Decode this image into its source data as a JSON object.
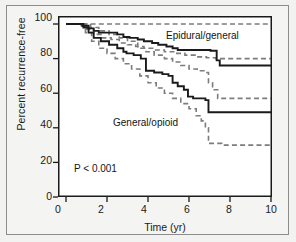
{
  "figure": {
    "background_color": "#f2f2f0",
    "plot_background": "#ffffff",
    "frame_color": "#8d8d8d"
  },
  "chart_data": {
    "type": "line",
    "subtype": "kaplan-meier-step",
    "title": "",
    "xlabel": "Time (yr)",
    "ylabel": "Percent recurrence-free",
    "xlim": [
      0,
      10
    ],
    "ylim": [
      0,
      100
    ],
    "xticks": [
      0,
      2,
      4,
      6,
      8,
      10
    ],
    "xtick_labels": [
      "0",
      "2",
      "4",
      "6",
      "8",
      "10"
    ],
    "yticks": [
      0,
      20,
      40,
      60,
      80,
      100
    ],
    "ytick_labels": [
      "0",
      "20",
      "40",
      "60",
      "80",
      "100"
    ],
    "grid": false,
    "legend_position": "inline-annotations",
    "annotations": [
      {
        "text": "Epidural/general",
        "x": 5.2,
        "y": 88
      },
      {
        "text": "General/opioid",
        "x": 2.7,
        "y": 42
      },
      {
        "text": "P < 0.001",
        "x": 0.85,
        "y": 17
      }
    ],
    "series": [
      {
        "name": "Epidural/general",
        "style": "solid",
        "color": "#1a1a1a",
        "width": 1.9,
        "points": [
          [
            0.0,
            100
          ],
          [
            0.45,
            100
          ],
          [
            0.8,
            99
          ],
          [
            1.1,
            97.5
          ],
          [
            1.35,
            96
          ],
          [
            1.6,
            95
          ],
          [
            2.25,
            95
          ],
          [
            2.5,
            94
          ],
          [
            2.8,
            92.5
          ],
          [
            3.1,
            92
          ],
          [
            3.5,
            91
          ],
          [
            3.8,
            90
          ],
          [
            4.2,
            89
          ],
          [
            4.5,
            88
          ],
          [
            4.9,
            87
          ],
          [
            5.2,
            86
          ],
          [
            5.45,
            85
          ],
          [
            5.8,
            85
          ],
          [
            6.3,
            85
          ],
          [
            6.75,
            85
          ],
          [
            7.05,
            84.5
          ],
          [
            7.35,
            79
          ],
          [
            7.5,
            76
          ],
          [
            8.2,
            76
          ],
          [
            9.0,
            76
          ],
          [
            10.0,
            76
          ]
        ]
      },
      {
        "name": "Epidural/general upper CI",
        "style": "dashed",
        "color": "#7c7c7c",
        "width": 1.6,
        "points": [
          [
            0.0,
            100
          ],
          [
            0.9,
            100
          ],
          [
            1.8,
            100
          ],
          [
            3.0,
            100
          ],
          [
            4.2,
            100
          ],
          [
            5.4,
            100
          ],
          [
            6.6,
            100
          ],
          [
            7.6,
            100
          ],
          [
            8.6,
            100
          ],
          [
            10.0,
            100
          ]
        ]
      },
      {
        "name": "Epidural/general lower CI",
        "style": "dashed",
        "color": "#7c7c7c",
        "width": 1.6,
        "points": [
          [
            0.0,
            100
          ],
          [
            0.7,
            99
          ],
          [
            1.0,
            97
          ],
          [
            1.35,
            94
          ],
          [
            1.7,
            92
          ],
          [
            2.2,
            91
          ],
          [
            2.6,
            89
          ],
          [
            3.0,
            88
          ],
          [
            3.4,
            87
          ],
          [
            3.8,
            86
          ],
          [
            4.3,
            85
          ],
          [
            4.8,
            84
          ],
          [
            5.3,
            83
          ],
          [
            5.8,
            82
          ],
          [
            6.3,
            81
          ],
          [
            6.85,
            80.5
          ],
          [
            7.3,
            80
          ],
          [
            8.0,
            80
          ],
          [
            9.0,
            80
          ],
          [
            10.0,
            80
          ]
        ]
      },
      {
        "name": "General/opioid",
        "style": "solid",
        "color": "#1a1a1a",
        "width": 1.9,
        "points": [
          [
            0.0,
            100
          ],
          [
            0.5,
            100
          ],
          [
            0.85,
            98
          ],
          [
            1.1,
            95
          ],
          [
            1.35,
            92
          ],
          [
            1.7,
            90
          ],
          [
            2.1,
            88
          ],
          [
            2.5,
            86
          ],
          [
            2.8,
            84
          ],
          [
            2.95,
            83
          ],
          [
            3.3,
            82
          ],
          [
            3.65,
            80
          ],
          [
            3.9,
            73
          ],
          [
            4.3,
            72
          ],
          [
            4.7,
            71
          ],
          [
            5.0,
            70
          ],
          [
            5.2,
            66
          ],
          [
            5.45,
            64
          ],
          [
            5.75,
            62
          ],
          [
            5.95,
            58
          ],
          [
            6.2,
            57
          ],
          [
            6.5,
            57
          ],
          [
            6.8,
            56
          ],
          [
            6.95,
            49
          ],
          [
            7.6,
            49
          ],
          [
            8.5,
            49
          ],
          [
            10.0,
            49
          ]
        ]
      },
      {
        "name": "General/opioid upper CI",
        "style": "dashed",
        "color": "#7c7c7c",
        "width": 1.6,
        "points": [
          [
            0.0,
            100
          ],
          [
            0.8,
            100
          ],
          [
            1.2,
            98
          ],
          [
            1.6,
            96
          ],
          [
            2.1,
            94
          ],
          [
            2.6,
            92
          ],
          [
            3.0,
            90
          ],
          [
            3.5,
            86
          ],
          [
            3.9,
            84
          ],
          [
            4.3,
            82
          ],
          [
            4.8,
            80
          ],
          [
            5.2,
            78
          ],
          [
            5.6,
            76
          ],
          [
            6.0,
            74
          ],
          [
            6.4,
            73
          ],
          [
            6.8,
            72
          ],
          [
            6.95,
            66
          ],
          [
            7.15,
            62
          ],
          [
            7.4,
            57
          ],
          [
            8.0,
            57
          ],
          [
            9.0,
            57
          ],
          [
            10.0,
            57
          ]
        ]
      },
      {
        "name": "General/opioid lower CI",
        "style": "dashed",
        "color": "#7c7c7c",
        "width": 1.6,
        "points": [
          [
            0.0,
            100
          ],
          [
            0.6,
            99
          ],
          [
            0.95,
            95
          ],
          [
            1.25,
            90
          ],
          [
            1.6,
            86
          ],
          [
            2.0,
            83
          ],
          [
            2.4,
            80
          ],
          [
            2.8,
            77
          ],
          [
            3.2,
            74
          ],
          [
            3.6,
            70
          ],
          [
            4.0,
            66
          ],
          [
            4.4,
            63
          ],
          [
            4.8,
            60
          ],
          [
            5.2,
            57
          ],
          [
            5.6,
            54
          ],
          [
            6.0,
            51
          ],
          [
            6.35,
            47
          ],
          [
            6.6,
            44
          ],
          [
            6.8,
            40
          ],
          [
            6.95,
            31
          ],
          [
            7.6,
            30
          ],
          [
            8.5,
            30
          ],
          [
            10.0,
            30
          ]
        ]
      }
    ]
  }
}
